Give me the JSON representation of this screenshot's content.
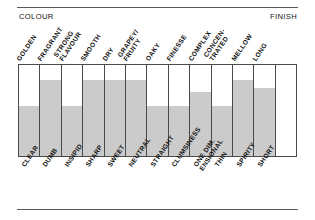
{
  "captions": {
    "left": "COLOUR",
    "right": "FINISH"
  },
  "chart_data": {
    "type": "bar",
    "title": "",
    "subtitle": "",
    "xlabel": "",
    "ylabel": "",
    "ylim": [
      0,
      100
    ],
    "grid": true,
    "legend": false,
    "legend_position": "none",
    "orientation": "vertical",
    "axis_caption_left": "COLOUR",
    "axis_caption_right": "FINISH",
    "top_labels": [
      "GOLDEN",
      "FRAGRANT",
      "STRONG FLAVOUR",
      "SMOOTH",
      "DRY",
      "GRAPEY/ FRUITY",
      "OAKY",
      "FINESSE",
      "COMPLEX",
      "CONCEN- TRATED",
      "MELLOW",
      "LONG",
      ""
    ],
    "bottom_labels": [
      "CLEAR",
      "DUMB",
      "INSIPID",
      "SHARP",
      "SWEET",
      "NEUTRAL",
      "STRAIGHT",
      "CLUMSINESS",
      "ONE DIM- ENSIONAL",
      "THIN",
      "SPIRITY",
      "SHORT",
      ""
    ],
    "categories": [
      "GOLDEN / CLEAR",
      "FRAGRANT / DUMB",
      "STRONG FLAVOUR / INSIPID",
      "SMOOTH / SHARP",
      "DRY / SWEET",
      "GRAPEY-FRUITY / NEUTRAL",
      "OAKY / STRAIGHT",
      "FINESSE / CLUMSINESS",
      "COMPLEX / ONE DIMENSIONAL",
      "CONCENTRATED / THIN",
      "MELLOW / SPIRITY",
      "LONG / SHORT",
      ""
    ],
    "values": [
      55,
      83,
      55,
      83,
      83,
      83,
      55,
      55,
      70,
      55,
      83,
      75,
      0
    ],
    "bar_color": "#cbcbcb",
    "grid_line_color": "#4a4a4a",
    "background_color": "#ffffff"
  },
  "columns": [
    {
      "top": "GOLDEN",
      "top2": "",
      "bottom": "CLEAR",
      "bottom2": "",
      "value": 55
    },
    {
      "top": "FRAGRANT",
      "top2": "",
      "bottom": "DUMB",
      "bottom2": "",
      "value": 83
    },
    {
      "top": "STRONG",
      "top2": "FLAVOUR",
      "bottom": "INSIPID",
      "bottom2": "",
      "value": 55
    },
    {
      "top": "SMOOTH",
      "top2": "",
      "bottom": "SHARP",
      "bottom2": "",
      "value": 83
    },
    {
      "top": "DRY",
      "top2": "",
      "bottom": "SWEET",
      "bottom2": "",
      "value": 83
    },
    {
      "top": "GRAPEY/",
      "top2": "FRUITY",
      "bottom": "NEUTRAL",
      "bottom2": "",
      "value": 83
    },
    {
      "top": "OAKY",
      "top2": "",
      "bottom": "STRAIGHT",
      "bottom2": "",
      "value": 55
    },
    {
      "top": "FINESSE",
      "top2": "",
      "bottom": "CLUMSINESS",
      "bottom2": "",
      "value": 55
    },
    {
      "top": "COMPLEX",
      "top2": "",
      "bottom": "ONE DIM.",
      "bottom2": "ENSIONAL",
      "value": 70
    },
    {
      "top": "CONCEN-",
      "top2": "TRATED",
      "bottom": "THIN",
      "bottom2": "",
      "value": 55
    },
    {
      "top": "MELLOW",
      "top2": "",
      "bottom": "SPIRITY",
      "bottom2": "",
      "value": 83
    },
    {
      "top": "LONG",
      "top2": "",
      "bottom": "SHORT",
      "bottom2": "",
      "value": 75
    },
    {
      "top": "",
      "top2": "",
      "bottom": "",
      "bottom2": "",
      "value": 0
    }
  ]
}
